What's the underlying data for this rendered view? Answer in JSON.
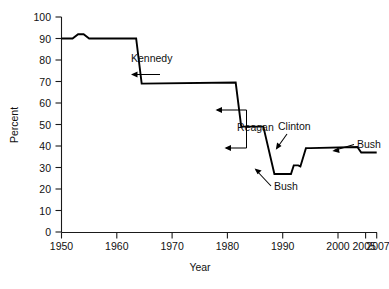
{
  "chart_data": {
    "type": "line",
    "title": "",
    "xlabel": "Year",
    "ylabel": "Percent",
    "xlim": [
      1950,
      2007
    ],
    "ylim": [
      0,
      100
    ],
    "grid": false,
    "legend_position": "none",
    "xticks": [
      1950,
      1960,
      1970,
      1980,
      1990,
      2000,
      2005,
      2007
    ],
    "xtick_labels": [
      "1950",
      "1960",
      "1970",
      "1980",
      "1990",
      "2000",
      "2005",
      "2007"
    ],
    "yticks": [
      0,
      10,
      20,
      30,
      40,
      50,
      60,
      70,
      80,
      90,
      100
    ],
    "ytick_labels": [
      "0",
      "10",
      "20",
      "30",
      "40",
      "50",
      "60",
      "70",
      "80",
      "90",
      "100"
    ],
    "series": [
      {
        "name": "Percent",
        "x": [
          1950,
          1952,
          1953,
          1954,
          1955,
          1963.5,
          1964.5,
          1981.5,
          1982.5,
          1986.5,
          1988.5,
          1991.5,
          1992,
          1992.8,
          1993.2,
          1994.2,
          1995,
          2003.5,
          2004.2,
          2005.2,
          2007
        ],
        "values": [
          90,
          90,
          92,
          92,
          90,
          90,
          69,
          69.5,
          49,
          49,
          27,
          27,
          31,
          31,
          30.5,
          39,
          39,
          39.5,
          37,
          37,
          37
        ]
      }
    ],
    "annotations": [
      {
        "label": "Kennedy",
        "points_to_year": 1964.2,
        "points_to_value": 73
      },
      {
        "label": "Reagan",
        "points_to_year": 1982.2,
        "points_to_value": 57
      },
      {
        "label": "Bush",
        "points_to_year": 1992.3,
        "points_to_value": 30
      },
      {
        "label": "Clinton",
        "points_to_year": 1994.4,
        "points_to_value": 39
      },
      {
        "label": "Bush",
        "points_to_year": 2004.6,
        "points_to_value": 38
      }
    ]
  },
  "axes": {
    "ylabel": "Percent",
    "xlabel": "Year",
    "ytick_labels": [
      "100",
      "90",
      "80",
      "70",
      "60",
      "50",
      "40",
      "30",
      "20",
      "10",
      "0"
    ],
    "xtick_labels": [
      "1950",
      "1960",
      "1970",
      "1980",
      "1990",
      "2000",
      "2005",
      "2007"
    ]
  },
  "annotations": {
    "kennedy": "Kennedy",
    "reagan": "Reagan",
    "bush_trough": "Bush",
    "clinton": "Clinton",
    "bush_right": "Bush"
  },
  "footer": {
    "ghost_text": ""
  }
}
